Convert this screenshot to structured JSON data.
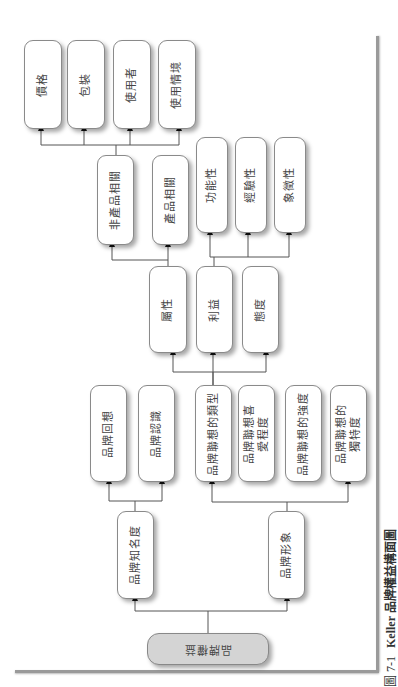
{
  "diagram": {
    "title": "Keller 品牌權益構面圖",
    "caption": {
      "figure_number": "圖 7-1",
      "text": "Keller 品牌權益構面圖"
    },
    "root": {
      "label": "品牌權益"
    },
    "level1": [
      {
        "id": "awareness",
        "label": "品牌知名度"
      },
      {
        "id": "image",
        "label": "品牌形象"
      }
    ],
    "awareness_children": [
      {
        "label": "品牌回想"
      },
      {
        "label": "品牌認識"
      }
    ],
    "image_children": [
      {
        "label": "品牌聯想的類型"
      },
      {
        "label": "品牌聯想喜\n愛程度"
      },
      {
        "label": "品牌聯想的強度"
      },
      {
        "label": "品牌聯想的\n獨特度"
      }
    ],
    "association_types": [
      {
        "label": "屬性"
      },
      {
        "label": "利益"
      },
      {
        "label": "態度"
      }
    ],
    "attribute_children": [
      {
        "label": "非產品相關"
      },
      {
        "label": "產品相關"
      }
    ],
    "benefit_children": [
      {
        "label": "功能性"
      },
      {
        "label": "經驗性"
      },
      {
        "label": "象徵性"
      }
    ],
    "non_product_children": [
      {
        "label": "價格"
      },
      {
        "label": "包裝"
      },
      {
        "label": "使用者"
      },
      {
        "label": "使用情境"
      }
    ],
    "colors": {
      "root_fill": "#d4d4d4",
      "node_fill": "#ffffff",
      "line": "#555555"
    }
  }
}
